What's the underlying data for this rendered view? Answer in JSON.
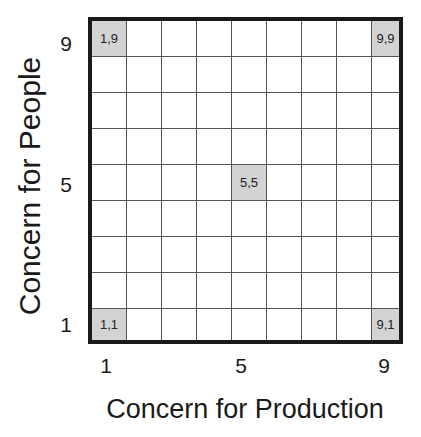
{
  "diagram": {
    "title": "",
    "type": "managerial-grid",
    "x_axis": {
      "label": "Concern for Production",
      "ticks": [
        "1",
        "5",
        "9"
      ]
    },
    "y_axis": {
      "label": "Concern for People",
      "ticks": [
        "9",
        "5",
        "1"
      ]
    },
    "grid_size": 9,
    "highlighted_cells": [
      {
        "label": "1,9",
        "col": 1,
        "row": 9
      },
      {
        "label": "9,9",
        "col": 9,
        "row": 9
      },
      {
        "label": "5,5",
        "col": 5,
        "row": 5
      },
      {
        "label": "1,1",
        "col": 1,
        "row": 1
      },
      {
        "label": "9,1",
        "col": 9,
        "row": 1
      }
    ],
    "colors": {
      "highlight": "#d3d3d3",
      "border": "#1a1a1a",
      "gridline": "#555555"
    }
  }
}
